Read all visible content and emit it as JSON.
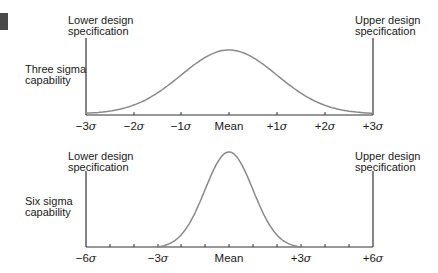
{
  "chart_data": [
    {
      "type": "line",
      "title": "Three sigma capability",
      "lower_spec_label": "Lower design specification",
      "upper_spec_label": "Upper design specification",
      "x_ticks": [
        "−3σ",
        "−2σ",
        "−1σ",
        "Mean",
        "+1σ",
        "+2σ",
        "+3σ"
      ],
      "x_range_sigma": [
        -3,
        3
      ],
      "curve": "normal distribution spanning ±3σ between specification limits",
      "grid": false
    },
    {
      "type": "line",
      "title": "Six sigma capability",
      "lower_spec_label": "Lower design specification",
      "upper_spec_label": "Upper design specification",
      "x_ticks": [
        "−6σ",
        "−3σ",
        "Mean",
        "+3σ",
        "+6σ"
      ],
      "x_range_sigma": [
        -6,
        6
      ],
      "curve": "narrower normal distribution spanning ±3σ, centered between specification limits at ±6σ",
      "grid": false
    }
  ],
  "top": {
    "lower_spec": [
      "Lower design",
      "specification"
    ],
    "upper_spec": [
      "Upper design",
      "specification"
    ],
    "side_label": [
      "Three sigma",
      "capability"
    ],
    "ticks": [
      "−3",
      "−2",
      "−1",
      "Mean",
      "+1",
      "+2",
      "+3"
    ]
  },
  "bottom": {
    "lower_spec": [
      "Lower design",
      "specification"
    ],
    "upper_spec": [
      "Upper design",
      "specification"
    ],
    "side_label": [
      "Six sigma",
      "capability"
    ],
    "ticks": [
      "−6",
      "−3",
      "Mean",
      "+3",
      "+6"
    ]
  },
  "sigma": "σ",
  "colors": {
    "axis": "#333333",
    "curve": "#8a8a8a",
    "marker": "#4a4a4a"
  }
}
